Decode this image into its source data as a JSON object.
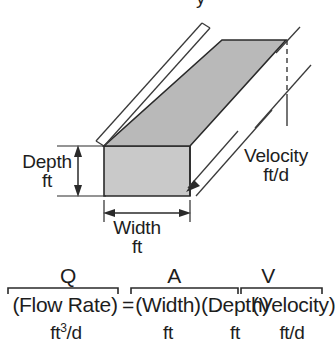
{
  "figure": {
    "title_clipped_remnant": "y",
    "background_color": "#ffffff",
    "ink_color": "#1d1d1d",
    "top_face_fill": "#b9b9b9",
    "front_face_fill": "#c9c9c9"
  },
  "diagram": {
    "name": "rectangular-channel-prism",
    "dimensions": [
      {
        "id": "depth",
        "name": "Depth",
        "unit": "ft",
        "annotation": "vertical-double-arrow"
      },
      {
        "id": "width",
        "name": "Width",
        "unit": "ft",
        "annotation": "horizontal-double-arrow"
      },
      {
        "id": "velocity",
        "name": "Velocity",
        "unit": "ft/d",
        "annotation": "diagonal-arrow"
      }
    ]
  },
  "equation": {
    "symbols": {
      "q": "Q",
      "a": "A",
      "v": "V"
    },
    "terms": {
      "flow_rate": "(Flow Rate)",
      "equals": "=",
      "width": "(Width)",
      "depth": "(Depth)",
      "velocity": "(Velocity)"
    },
    "units": {
      "flow_rate": "ft",
      "flow_rate_exponent": "3",
      "flow_rate_tail": "/d",
      "width": "ft",
      "depth": "ft",
      "velocity": "ft/d"
    }
  }
}
